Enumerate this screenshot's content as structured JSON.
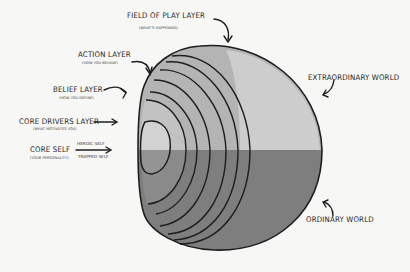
{
  "diagram": {
    "type": "nested-sphere-layers",
    "labels": {
      "field_of_play": {
        "title": "FIELD OF PLAY LAYER",
        "subtitle": "(WHAT'S HAPPENING)"
      },
      "action": {
        "title": "ACTION LAYER",
        "subtitle": "(HOW YOU BEHAVE)"
      },
      "belief": {
        "title": "BELIEF LAYER",
        "subtitle": "(HOW YOU DEFINE)"
      },
      "core_drivers": {
        "title": "CORE DRIVERS LAYER",
        "subtitle": "(WHAT MOTIVATES YOU)"
      },
      "core_self": {
        "title": "CORE SELF",
        "subtitle": "(YOUR PERSONALITY)"
      },
      "heroic_self": "HEROIC SELF",
      "trapped_self": "TRAPPED SELF",
      "extraordinary_world": "EXTRAORDINARY WORLD",
      "ordinary_world": "ORDINARY WORLD"
    },
    "colors": {
      "background": "#f7f7f6",
      "upper_half": "#b4b4b4",
      "upper_highlight": "#cfcfcf",
      "lower_half": "#7e7e7e",
      "outline": "#1e1e1e"
    }
  }
}
